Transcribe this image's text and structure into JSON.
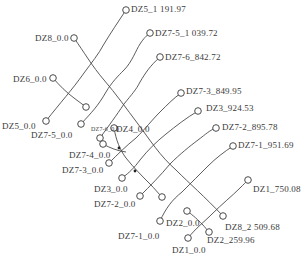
{
  "diagram": {
    "type": "borehole-trajectory-plan",
    "stroke_color": "#4a4a4a",
    "text_color": "#3a3a3a",
    "labels": [
      {
        "id": "dz5-1-top",
        "text": "DZ5_1 191.97",
        "x": 131,
        "y": 4
      },
      {
        "id": "dz8-top",
        "text": "DZ8_0.0",
        "x": 35,
        "y": 14
      },
      {
        "id": "dz7-5-end",
        "text": "DZ7-5_1 039.72",
        "x": 155,
        "y": 29
      },
      {
        "id": "dz7-6-end",
        "text": "DZ7-6_842.72",
        "x": 165,
        "y": 52
      },
      {
        "id": "dz6-top",
        "text": "DZ6_0.0",
        "x": 13,
        "y": 75
      },
      {
        "id": "dz7-3-end",
        "text": "DZ7-3_849.95",
        "x": 186,
        "y": 86
      },
      {
        "id": "dz3-end",
        "text": "DZ3_924.53",
        "x": 206,
        "y": 104
      },
      {
        "id": "dz7-2-end",
        "text": "DZ7-2_895.78",
        "x": 225,
        "y": 122
      },
      {
        "id": "dz5-top",
        "text": "DZ5_0.0",
        "x": 2,
        "y": 122
      },
      {
        "id": "dz7-5-top",
        "text": "DZ7-5_0.0",
        "x": 31,
        "y": 130
      },
      {
        "id": "dz7-6-top",
        "text": "DZ7-6_0.0",
        "x": 90,
        "y": 126,
        "tiny": true
      },
      {
        "id": "dz4-top",
        "text": "DZ4_0.0",
        "x": 116,
        "y": 124
      },
      {
        "id": "dz7-1-end",
        "text": "DZ7-1_951.69",
        "x": 238,
        "y": 140
      },
      {
        "id": "dz7-4-top",
        "text": "DZ7-4_0.0",
        "x": 69,
        "y": 149
      },
      {
        "id": "dz7-3-top",
        "text": "DZ7-3_0.0",
        "x": 62,
        "y": 164
      },
      {
        "id": "dz3-top",
        "text": "DZ3_0.0",
        "x": 94,
        "y": 185
      },
      {
        "id": "dz7-2-top",
        "text": "DZ7-2_0.0",
        "x": 94,
        "y": 200
      },
      {
        "id": "dz1-end",
        "text": "DZ1_750.08",
        "x": 253,
        "y": 185
      },
      {
        "id": "dz8-end",
        "text": "DZ8_2 509.68",
        "x": 225,
        "y": 226
      },
      {
        "id": "dz2-top",
        "text": "DZ2_0.0",
        "x": 166,
        "y": 219
      },
      {
        "id": "dz7-1-top",
        "text": "DZ7-1_0.0",
        "x": 118,
        "y": 231
      },
      {
        "id": "dz2-end",
        "text": "DZ2_259.96",
        "x": 207,
        "y": 240
      },
      {
        "id": "dz1-top",
        "text": "DZ1_0.0",
        "x": 172,
        "y": 244
      }
    ],
    "holes": [
      {
        "id": "DZ5",
        "start": [
          46,
          121
        ],
        "end": [
          126,
          10
        ]
      },
      {
        "id": "DZ8",
        "start": [
          74,
          38
        ],
        "end": [
          223,
          216
        ]
      },
      {
        "id": "DZ6",
        "start": [
          53,
          78
        ],
        "end": [
          86,
          107
        ]
      },
      {
        "id": "DZ7-5",
        "start": [
          81,
          124
        ],
        "end": [
          150,
          33
        ]
      },
      {
        "id": "DZ7-6",
        "start": [
          100,
          138
        ],
        "end": [
          160,
          57
        ]
      },
      {
        "id": "DZ4",
        "start": [
          114,
          128
        ],
        "end": [
          162,
          197
        ]
      },
      {
        "id": "DZ7-4",
        "start": [
          103,
          144
        ],
        "end": [
          126,
          152
        ]
      },
      {
        "id": "DZ7-3",
        "start": [
          109,
          163
        ],
        "end": [
          181,
          93
        ]
      },
      {
        "id": "DZ3",
        "start": [
          122,
          178
        ],
        "end": [
          198,
          111
        ]
      },
      {
        "id": "DZ7-2",
        "start": [
          140,
          196
        ],
        "end": [
          216,
          128
        ]
      },
      {
        "id": "DZ7-1",
        "start": [
          160,
          221
        ],
        "end": [
          233,
          146
        ]
      },
      {
        "id": "DZ1",
        "start": [
          188,
          238
        ],
        "end": [
          248,
          180
        ]
      },
      {
        "id": "DZ2",
        "start": [
          187,
          211
        ],
        "end": [
          209,
          232
        ]
      }
    ]
  }
}
